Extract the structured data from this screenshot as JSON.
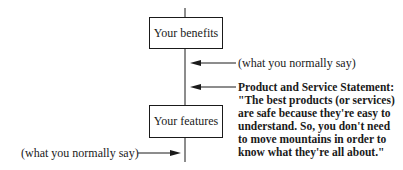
{
  "diagram": {
    "boxes": {
      "top": "Your benefits",
      "bottom": "Your features"
    },
    "labels": {
      "upper_right": "(what you normally say)",
      "lower_left": "(what you normally say)"
    },
    "statement": {
      "title": "Product and Service Statement:",
      "lines": [
        "\"The best products (or services)",
        "are safe because they're easy to",
        "understand. So, you don't need",
        "to move mountains in order to",
        "know what they're all about.\""
      ]
    },
    "colors": {
      "ink": "#1a1a1a",
      "background": "#ffffff"
    }
  }
}
